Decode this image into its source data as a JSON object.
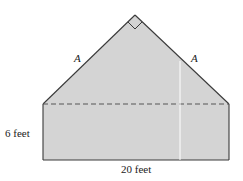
{
  "diagram": {
    "type": "house-shaped figure: rectangle topped by right isosceles triangle",
    "labels": {
      "left_slant": "A",
      "right_slant": "A",
      "height": "6 feet",
      "width": "20 feet"
    },
    "markers": {
      "apex_angle": "right-angle-marker"
    },
    "colors": {
      "fill": "#d4d4d4",
      "stroke": "#3a3a3a",
      "dashed": "#555555",
      "divider": "#ffffff"
    }
  }
}
